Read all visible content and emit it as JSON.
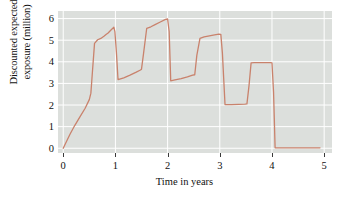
{
  "chart_data": {
    "type": "line",
    "title": "",
    "subtitle": "",
    "xlabel": "Time in years",
    "ylabel": "Discounted expected exposure (million)",
    "ylabel_line1": "Discounted expected",
    "ylabel_line2": "exposure (million)",
    "xlim": [
      -0.1,
      5.15
    ],
    "ylim": [
      -0.22,
      6.35
    ],
    "xticks": [
      0,
      1,
      2,
      3,
      4,
      5
    ],
    "xtick_labels": [
      "0",
      "1",
      "2",
      "3",
      "4",
      "5"
    ],
    "yticks": [
      0,
      1,
      2,
      3,
      4,
      5,
      6
    ],
    "ytick_labels": [
      "0",
      "1",
      "2",
      "3",
      "4",
      "5",
      "6"
    ],
    "grid": true,
    "grid_color": "#ffffff",
    "plot_background": "#dcdfdc",
    "legend": "none",
    "series": [
      {
        "name": "Discounted expected exposure",
        "color": "#c9826c",
        "line_width": 1.3,
        "x": [
          0.0,
          0.06,
          0.13,
          0.22,
          0.32,
          0.42,
          0.5,
          0.53,
          0.56,
          0.6,
          0.66,
          0.72,
          0.78,
          0.82,
          0.86,
          0.92,
          0.97,
          0.99,
          1.02,
          1.05,
          1.16,
          1.28,
          1.4,
          1.48,
          1.5,
          1.54,
          1.6,
          1.68,
          1.76,
          1.86,
          1.96,
          2.0,
          2.03,
          2.06,
          2.14,
          2.26,
          2.38,
          2.48,
          2.52,
          2.56,
          2.62,
          2.7,
          2.8,
          2.9,
          2.98,
          3.02,
          3.05,
          3.1,
          3.22,
          3.36,
          3.48,
          3.52,
          3.56,
          3.6,
          3.66,
          3.76,
          3.88,
          3.97,
          4.0,
          4.03,
          4.06,
          4.2,
          4.45,
          4.7,
          4.92
        ],
        "y": [
          0.0,
          0.3,
          0.65,
          1.05,
          1.45,
          1.85,
          2.25,
          2.55,
          3.55,
          4.85,
          5.02,
          5.08,
          5.18,
          5.26,
          5.33,
          5.48,
          5.6,
          5.4,
          4.4,
          3.18,
          3.26,
          3.38,
          3.52,
          3.62,
          3.66,
          4.4,
          5.55,
          5.62,
          5.72,
          5.84,
          5.96,
          5.98,
          5.4,
          3.12,
          3.16,
          3.22,
          3.3,
          3.38,
          3.4,
          4.3,
          5.08,
          5.15,
          5.2,
          5.25,
          5.28,
          5.27,
          4.4,
          2.02,
          2.02,
          2.03,
          2.04,
          2.05,
          2.9,
          3.95,
          3.96,
          3.96,
          3.96,
          3.96,
          3.95,
          2.6,
          0.02,
          0.02,
          0.02,
          0.02,
          0.02
        ]
      }
    ],
    "annotations": []
  }
}
